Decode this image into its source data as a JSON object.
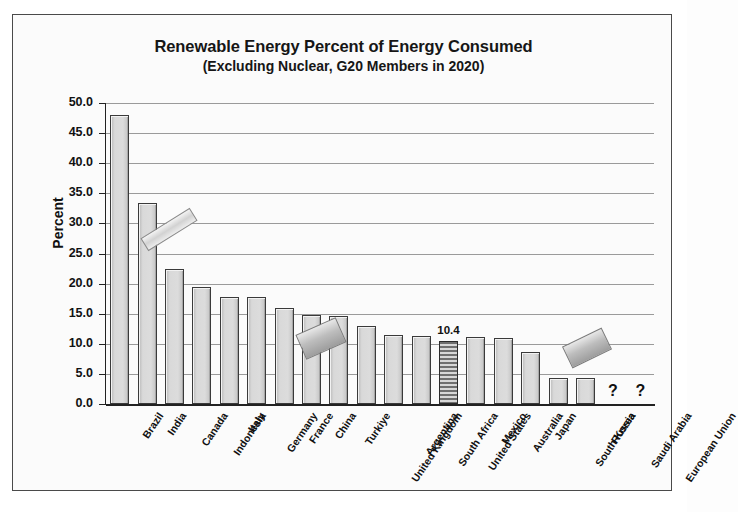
{
  "chart_data": {
    "type": "bar",
    "title": "Renewable Energy Percent of Energy Consumed",
    "subtitle": "(Excluding Nuclear, G20 Members in 2020)",
    "xlabel": "",
    "ylabel": "Percent",
    "ylim": [
      0,
      50
    ],
    "ytick_step": 5,
    "grid": true,
    "legend": "none",
    "ytick_labels": [
      "0.0",
      "5.0",
      "10.0",
      "15.0",
      "20.0",
      "25.0",
      "30.0",
      "35.0",
      "40.0",
      "45.0",
      "50.0"
    ],
    "categories": [
      "Brazil",
      "India",
      "Canada",
      "Indonesia",
      "Italy",
      "Germany",
      "France",
      "China",
      "Turkiye",
      "United Kingdom",
      "Argentina",
      "South Africa",
      "United States",
      "Mexico",
      "Australia",
      "Japan",
      "South Korea",
      "Russia",
      "Saudi Arabia",
      "European Union"
    ],
    "values": [
      48.0,
      33.4,
      22.4,
      19.5,
      17.8,
      17.8,
      16.0,
      14.8,
      14.7,
      12.9,
      11.5,
      11.3,
      10.4,
      11.1,
      11.0,
      8.6,
      4.4,
      4.4,
      null,
      null
    ],
    "data_labels": {
      "United States": "10.4"
    },
    "unknown_marker": "?",
    "unknown_categories": [
      "Saudi Arabia",
      "European Union"
    ],
    "highlighted_category": "United States",
    "annotations": [
      {
        "name": "marker-over-india",
        "note": "rotated grey band across India bar"
      },
      {
        "name": "marker-over-china",
        "note": "rotated grey slab over China bar"
      },
      {
        "name": "marker-over-saudi-arabia",
        "note": "rotated grey slab above Saudi Arabia"
      }
    ],
    "colors": {
      "bar_fill": "#d9d9d9",
      "bar_edge": "#3a3a3a",
      "highlight_fill": "#8e8e8e",
      "grid": "#9a9a9a",
      "axis": "#222222",
      "text": "#111111",
      "background": "#fbfbfb"
    }
  }
}
